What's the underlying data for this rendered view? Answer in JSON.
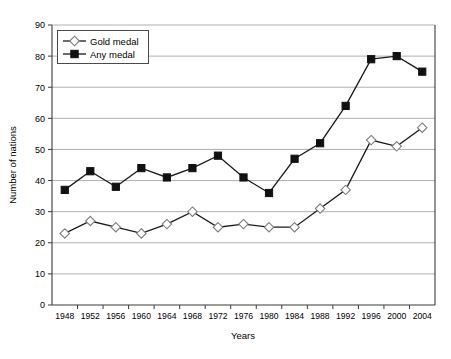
{
  "chart_data": {
    "type": "line",
    "title": "",
    "xlabel": "Years",
    "ylabel": "Number of nations",
    "categories": [
      "1948",
      "1952",
      "1956",
      "1960",
      "1964",
      "1968",
      "1972",
      "1976",
      "1980",
      "1984",
      "1988",
      "1992",
      "1996",
      "2000",
      "2004"
    ],
    "x": [
      1948,
      1952,
      1956,
      1960,
      1964,
      1968,
      1972,
      1976,
      1980,
      1984,
      1988,
      1992,
      1996,
      2000,
      2004
    ],
    "series": [
      {
        "name": "Gold medal",
        "marker": "open-diamond",
        "values": [
          23,
          27,
          25,
          23,
          26,
          30,
          25,
          26,
          25,
          25,
          31,
          37,
          53,
          51,
          57
        ]
      },
      {
        "name": "Any medal",
        "marker": "filled-square",
        "values": [
          37,
          43,
          38,
          44,
          41,
          44,
          48,
          41,
          36,
          47,
          52,
          64,
          79,
          80,
          75
        ]
      }
    ],
    "ylim": [
      0,
      90
    ],
    "yticks": [
      0,
      10,
      20,
      30,
      40,
      50,
      60,
      70,
      80,
      90
    ],
    "ytick_labels": [
      "0",
      "10",
      "20",
      "30",
      "40",
      "50",
      "60",
      "70",
      "80",
      "90"
    ],
    "grid": true,
    "grid_axis": "y",
    "legend_position": "top-left",
    "legend_entries": [
      "Gold medal",
      "Any medal"
    ],
    "colors": {
      "line": "#1a1a1a",
      "gold_marker_fill": "#ffffff",
      "gold_marker_stroke": "#7d7d7d",
      "any_marker_fill": "#111111",
      "gridline": "#9c9c9c",
      "axis": "#3b3b3b",
      "background": "#ffffff"
    }
  },
  "caption": {
    "text": ""
  }
}
